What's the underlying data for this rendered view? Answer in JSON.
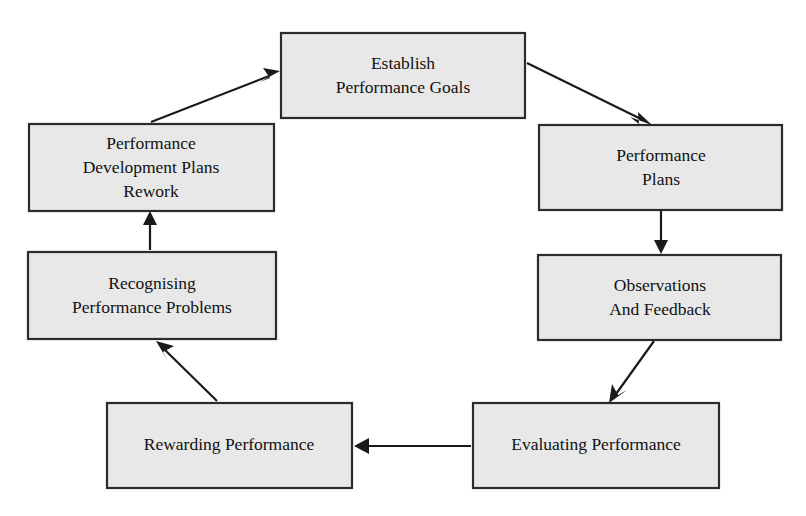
{
  "diagram": {
    "type": "cyclical-flow-diagram",
    "background_color": "#ffffff",
    "box_fill_color": "#e8e8e8",
    "box_border_color": "#2b2b2b",
    "arrow_color": "#1a1a1a",
    "nodes": [
      {
        "id": "establish-performance-goals",
        "lines": [
          "Establish",
          "Performance Goals"
        ],
        "line1": "Establish",
        "line2": "Performance Goals",
        "line3": "",
        "x": 281,
        "y": 33,
        "width": 244,
        "height": 85
      },
      {
        "id": "performance-plans",
        "lines": [
          "Performance",
          "Plans"
        ],
        "line1": "Performance",
        "line2": "Plans",
        "line3": "",
        "x": 539,
        "y": 125,
        "width": 243,
        "height": 85
      },
      {
        "id": "observations-and-feedback",
        "lines": [
          "Observations",
          "And Feedback"
        ],
        "line1": "Observations",
        "line2": "And Feedback",
        "line3": "",
        "x": 538,
        "y": 255,
        "width": 243,
        "height": 85
      },
      {
        "id": "evaluating-performance",
        "lines": [
          "Evaluating Performance"
        ],
        "line1": "Evaluating Performance",
        "line2": "",
        "line3": "",
        "x": 473,
        "y": 403,
        "width": 246,
        "height": 85
      },
      {
        "id": "rewarding-performance",
        "lines": [
          "Rewarding Performance"
        ],
        "line1": "Rewarding Performance",
        "line2": "",
        "line3": "",
        "x": 107,
        "y": 403,
        "width": 245,
        "height": 85
      },
      {
        "id": "recognising-performance-problems",
        "lines": [
          "Recognising",
          "Performance Problems"
        ],
        "line1": "Recognising",
        "line2": "Performance Problems",
        "line3": "",
        "x": 28,
        "y": 252,
        "width": 248,
        "height": 87
      },
      {
        "id": "performance-development-plans-rework",
        "lines": [
          "Performance",
          "Development Plans",
          "Rework"
        ],
        "line1": "Performance",
        "line2": "Development Plans",
        "line3": "Rework",
        "x": 29,
        "y": 124,
        "width": 245,
        "height": 87
      }
    ],
    "edges": [
      {
        "id": "goals-to-plans",
        "from": "establish-performance-goals",
        "to": "performance-plans",
        "style": "diagonal-down-right",
        "x1": 527,
        "y1": 63,
        "x2": 649,
        "y2": 123
      },
      {
        "id": "plans-to-observations",
        "from": "performance-plans",
        "to": "observations-and-feedback",
        "style": "vertical-down",
        "x1": 661,
        "y1": 211,
        "x2": 661,
        "y2": 253
      },
      {
        "id": "observations-to-evaluating",
        "from": "observations-and-feedback",
        "to": "evaluating-performance",
        "style": "diagonal-down-left",
        "x1": 654,
        "y1": 341,
        "x2": 611,
        "y2": 401
      },
      {
        "id": "evaluating-to-rewarding",
        "from": "evaluating-performance",
        "to": "rewarding-performance",
        "style": "horizontal-left",
        "x1": 471,
        "y1": 446,
        "x2": 354,
        "y2": 446
      },
      {
        "id": "rewarding-to-recognising",
        "from": "rewarding-performance",
        "to": "recognising-performance-problems",
        "style": "diagonal-up-left",
        "x1": 217,
        "y1": 401,
        "x2": 158,
        "y2": 341
      },
      {
        "id": "recognising-to-development-plans",
        "from": "recognising-performance-problems",
        "to": "performance-development-plans-rework",
        "style": "vertical-up",
        "x1": 150,
        "y1": 250,
        "x2": 150,
        "y2": 213
      },
      {
        "id": "development-plans-to-goals",
        "from": "performance-development-plans-rework",
        "to": "establish-performance-goals",
        "style": "diagonal-up-right",
        "x1": 151,
        "y1": 122,
        "x2": 279,
        "y2": 72
      }
    ]
  }
}
